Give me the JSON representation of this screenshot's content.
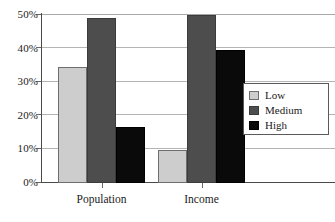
{
  "chart_data": {
    "type": "bar",
    "title": "",
    "subtitle": "",
    "xlabel": "",
    "ylabel": "",
    "categories": [
      "Population",
      "Income"
    ],
    "series": [
      {
        "name": "Low",
        "color": "#cdcdcd",
        "values": [
          34.5,
          9.7
        ]
      },
      {
        "name": "Medium",
        "color": "#4d4d4d",
        "values": [
          49.0,
          50.0
        ]
      },
      {
        "name": "High",
        "color": "#0a0a0a",
        "values": [
          16.7,
          39.5
        ]
      }
    ],
    "ylim": [
      0,
      50
    ],
    "ytick_values": [
      0,
      10,
      20,
      30,
      40,
      50
    ],
    "ytick_labels": [
      "0%",
      "10%",
      "20%",
      "30%",
      "40%",
      "50%"
    ],
    "grid": true,
    "grid_axis": "y",
    "legend_position": "center-right",
    "value_suffix": "%"
  },
  "legend": {
    "entries": [
      {
        "label": "Low"
      },
      {
        "label": "Medium"
      },
      {
        "label": "High"
      }
    ]
  },
  "axes": {
    "y_tick_labels": [
      "50%",
      "40%",
      "30%",
      "20%",
      "10%",
      "0%"
    ],
    "x_tick_labels": [
      "Population",
      "Income"
    ]
  }
}
